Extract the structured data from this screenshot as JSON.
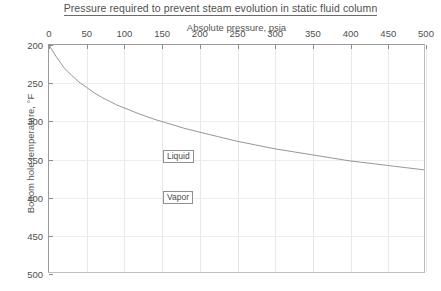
{
  "chart": {
    "title": "Pressure required to prevent steam evolution in static fluid column",
    "xaxis_title": "Absolute pressure, psia",
    "yaxis_title": "Bottom hole temperature, °F",
    "region_labels": {
      "liquid": "Liquid",
      "vapor": "Vapor"
    },
    "xticks": [
      "0",
      "50",
      "100",
      "150",
      "200",
      "250",
      "300",
      "350",
      "400",
      "450",
      "500"
    ],
    "yticks": [
      "200",
      "250",
      "300",
      "350",
      "400",
      "450",
      "500"
    ],
    "colors": {
      "curve": "#8a8a8a",
      "grid": "#e8e8e8",
      "axis": "#9a9a9a",
      "text": "#4f4f4f",
      "background": "#ffffff"
    }
  },
  "chart_data": {
    "type": "line",
    "title": "Pressure required to prevent steam evolution in static fluid column",
    "xlabel": "Absolute pressure, psia",
    "ylabel": "Bottom hole temperature, °F",
    "xlim": [
      0,
      500
    ],
    "ylim": [
      200,
      500
    ],
    "y_axis_inverted": true,
    "x_axis_position": "top",
    "grid": true,
    "legend": "none",
    "annotations": [
      {
        "text": "Liquid",
        "x": 155,
        "y": 348,
        "region": "above-curve"
      },
      {
        "text": "Vapor",
        "x": 155,
        "y": 398,
        "region": "below-curve"
      }
    ],
    "xticks": [
      0,
      50,
      100,
      150,
      200,
      250,
      300,
      350,
      400,
      450,
      500
    ],
    "yticks": [
      200,
      250,
      300,
      350,
      400,
      450,
      500
    ],
    "series": [
      {
        "name": "Saturation temperature",
        "x": [
          0,
          10,
          20,
          30,
          40,
          50,
          60,
          70,
          80,
          90,
          100,
          120,
          140,
          160,
          180,
          200,
          225,
          250,
          275,
          300,
          325,
          350,
          375,
          400,
          425,
          450,
          475,
          500
        ],
        "y": [
          200,
          216,
          230,
          240,
          249,
          256,
          263,
          269,
          274,
          279,
          283,
          291,
          298,
          304,
          310,
          315,
          321,
          327,
          332,
          337,
          341,
          345,
          349,
          353,
          356,
          359,
          362,
          365
        ]
      }
    ]
  }
}
